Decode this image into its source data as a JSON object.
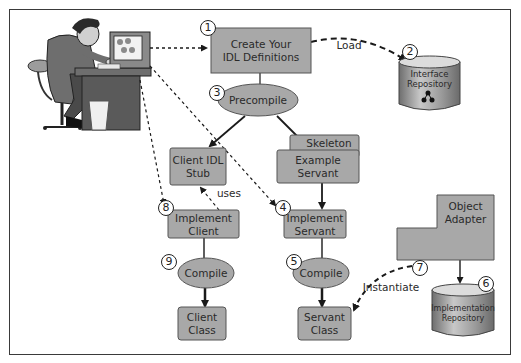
{
  "diagram": {
    "colors": {
      "box_fill": "#a8a8a8",
      "box_border": "#555555",
      "ellipse_fill": "#a8a8a8",
      "cylinder_fill": "#9a9a9a",
      "line": "#1a1a1a",
      "frame": "#3a3a3a",
      "background": "#ffffff"
    },
    "nodes": {
      "create_idl": {
        "step": "1",
        "label": "Create Your IDL Definitions",
        "line1": "Create Your",
        "line2": "IDL Definitions",
        "shape": "box"
      },
      "interface_repo": {
        "step": "2",
        "label": "Interface Repository",
        "line1": "Interface",
        "line2": "Repository",
        "shape": "cylinder"
      },
      "precompile": {
        "step": "3",
        "label": "Precompile",
        "shape": "ellipse"
      },
      "client_stub": {
        "label": "Client IDL Stub",
        "line1": "Client IDL",
        "line2": "Stub",
        "shape": "box"
      },
      "skeleton": {
        "label": "Skeleton",
        "shape": "box"
      },
      "example_servant": {
        "label": "Example Servant",
        "line1": "Example",
        "line2": "Servant",
        "shape": "box"
      },
      "implement_servant": {
        "step": "4",
        "label": "Implement Servant",
        "line1": "Implement",
        "line2": "Servant",
        "shape": "box"
      },
      "compile_servant": {
        "step": "5",
        "label": "Compile",
        "shape": "ellipse"
      },
      "impl_repo": {
        "step": "6",
        "label": "Implementation Repository",
        "line1": "Implementation",
        "line2": "Repository",
        "shape": "cylinder"
      },
      "object_adapter": {
        "step": "7",
        "label": "Object Adapter",
        "line1": "Object",
        "line2": "Adapter",
        "shape": "box"
      },
      "implement_client": {
        "step": "8",
        "label": "Implement Client",
        "line1": "Implement",
        "line2": "Client",
        "shape": "box"
      },
      "compile_client": {
        "step": "9",
        "label": "Compile",
        "shape": "ellipse"
      },
      "client_class": {
        "label": "Client Class",
        "line1": "Client",
        "line2": "Class",
        "shape": "box"
      },
      "servant_class": {
        "label": "Servant Class",
        "line1": "Servant",
        "line2": "Class",
        "shape": "box"
      },
      "developer": {
        "label": "Developer at workstation",
        "shape": "illustration"
      }
    },
    "edges": [
      {
        "from": "developer",
        "to": "create_idl",
        "style": "dotted"
      },
      {
        "from": "create_idl",
        "to": "interface_repo",
        "style": "dashed",
        "label": "Load"
      },
      {
        "from": "create_idl",
        "to": "precompile",
        "style": "solid"
      },
      {
        "from": "precompile",
        "to": "client_stub",
        "style": "solid"
      },
      {
        "from": "precompile",
        "to": "skeleton",
        "style": "solid"
      },
      {
        "from": "developer",
        "to": "implement_client",
        "style": "dotted"
      },
      {
        "from": "developer",
        "to": "implement_servant",
        "style": "dotted"
      },
      {
        "from": "implement_client",
        "to": "client_stub",
        "style": "dashed",
        "label": "uses"
      },
      {
        "from": "example_servant",
        "to": "implement_servant",
        "style": "solid"
      },
      {
        "from": "implement_client",
        "to": "compile_client",
        "style": "solid"
      },
      {
        "from": "compile_client",
        "to": "client_class",
        "style": "solid"
      },
      {
        "from": "implement_servant",
        "to": "compile_servant",
        "style": "solid"
      },
      {
        "from": "compile_servant",
        "to": "servant_class",
        "style": "solid"
      },
      {
        "from": "object_adapter",
        "to": "servant_class",
        "style": "dashed",
        "label": "Instantiate"
      },
      {
        "from": "object_adapter",
        "to": "impl_repo",
        "style": "solid"
      }
    ],
    "edge_labels": {
      "load": "Load",
      "uses": "uses",
      "instantiate": "Instantiate"
    }
  }
}
